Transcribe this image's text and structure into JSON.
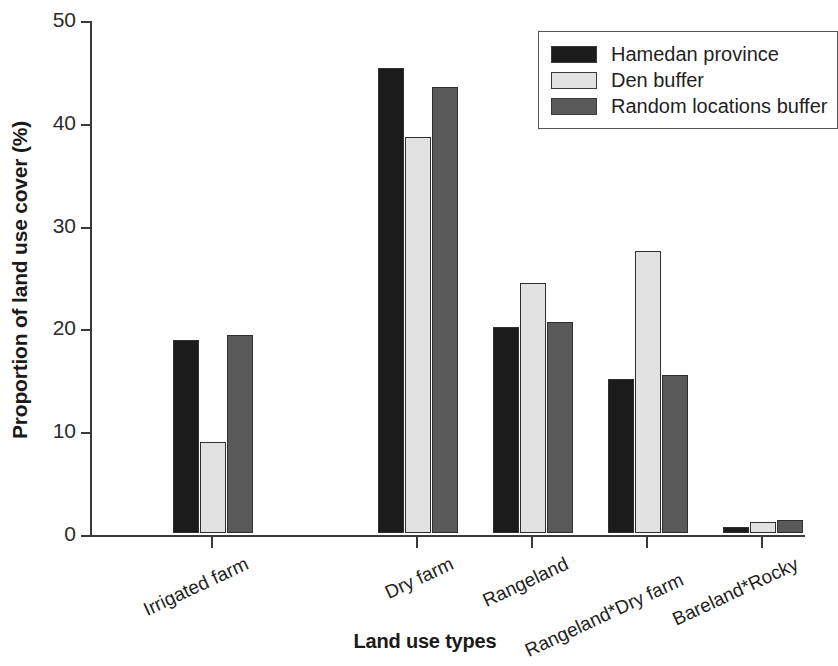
{
  "chart_data": {
    "type": "bar",
    "title": "",
    "xlabel": "Land use types",
    "ylabel": "Proportion of land use cover (%)",
    "ylim": [
      0,
      50
    ],
    "yticks": [
      0,
      10,
      20,
      30,
      40,
      50
    ],
    "ytick_labels": [
      "0",
      "10",
      "20",
      "30",
      "40",
      "50"
    ],
    "grid": false,
    "legend_position": "top-right",
    "categories": [
      "Irrigated farm",
      "Dry farm",
      "Rangeland",
      "Rangeland*Dry farm",
      "Bareland*Rocky"
    ],
    "series": [
      {
        "name": "Hamedan province",
        "color": "#1b1b1b",
        "values": [
          18.8,
          45.2,
          20.0,
          15.0,
          0.6
        ]
      },
      {
        "name": "Den buffer",
        "color": "#e2e2e2",
        "values": [
          8.9,
          38.5,
          24.3,
          27.4,
          1.1
        ]
      },
      {
        "name": "Random locations buffer",
        "color": "#595959",
        "values": [
          19.3,
          43.4,
          20.5,
          15.4,
          1.3
        ]
      }
    ]
  }
}
